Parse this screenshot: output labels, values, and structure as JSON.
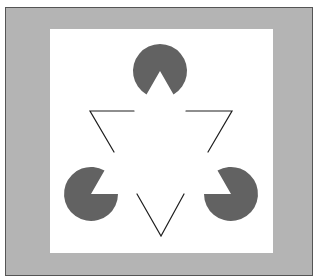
{
  "figure": {
    "colors": {
      "page": "#ffffff",
      "frame": "#b4b4b4",
      "frame_border": "#555555",
      "panel": "#ffffff",
      "pacman": "#626262",
      "line": "#1e1e1e"
    },
    "pacmen": [
      {
        "position": "top",
        "cx": 160,
        "cy": 71,
        "r": 27,
        "mouth": "down"
      },
      {
        "position": "bottom-left",
        "cx": 91,
        "cy": 194,
        "r": 27,
        "mouth": "upper-right"
      },
      {
        "position": "bottom-right",
        "cx": 231,
        "cy": 194,
        "r": 27,
        "mouth": "upper-left"
      }
    ],
    "line_corners": [
      {
        "position": "top-left",
        "vertex": [
          90,
          111
        ]
      },
      {
        "position": "top-right",
        "vertex": [
          232,
          111
        ]
      },
      {
        "position": "bottom",
        "vertex": [
          161,
          236
        ]
      }
    ]
  }
}
